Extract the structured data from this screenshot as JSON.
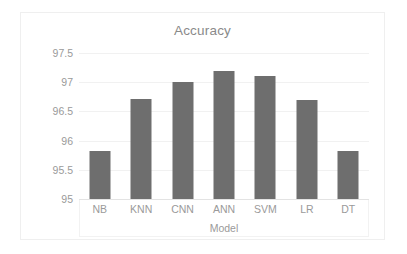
{
  "chart_data": {
    "type": "bar",
    "title": "Accuracy",
    "xlabel": "Model",
    "ylabel": "",
    "categories": [
      "NB",
      "KNN",
      "CNN",
      "ANN",
      "SVM",
      "LR",
      "DT"
    ],
    "values": [
      95.82,
      96.72,
      97.0,
      97.2,
      97.1,
      96.7,
      95.82
    ],
    "ylim": [
      95,
      97.5
    ],
    "ytick_labels": [
      "97.5",
      "97",
      "96.5",
      "96",
      "95.5",
      "95"
    ],
    "ytick_values": [
      97.5,
      97,
      96.5,
      96,
      95.5,
      95
    ],
    "grid": true,
    "legend": "none",
    "series": [
      {
        "name": "Accuracy",
        "values": [
          95.82,
          96.72,
          97.0,
          97.2,
          97.1,
          96.7,
          95.82
        ]
      }
    ],
    "colors": {
      "bar": "#6e6e6e",
      "gridline": "#f1f1f1",
      "axis": "#e3e3e3",
      "text": "#9a9a9a",
      "title_text": "#8a8a8a",
      "frame_border": "#efefef",
      "background": "#ffffff"
    }
  }
}
